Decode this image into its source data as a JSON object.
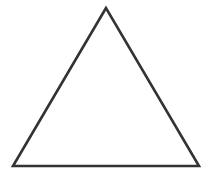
{
  "diagram": {
    "shape": "triangle",
    "type": "equilateral-outline",
    "vertices": [
      {
        "x": 106,
        "y": 8
      },
      {
        "x": 13,
        "y": 166
      },
      {
        "x": 199,
        "y": 166
      }
    ],
    "stroke_color": "#333333",
    "stroke_width": 2.6,
    "fill_color": "#ffffff"
  }
}
